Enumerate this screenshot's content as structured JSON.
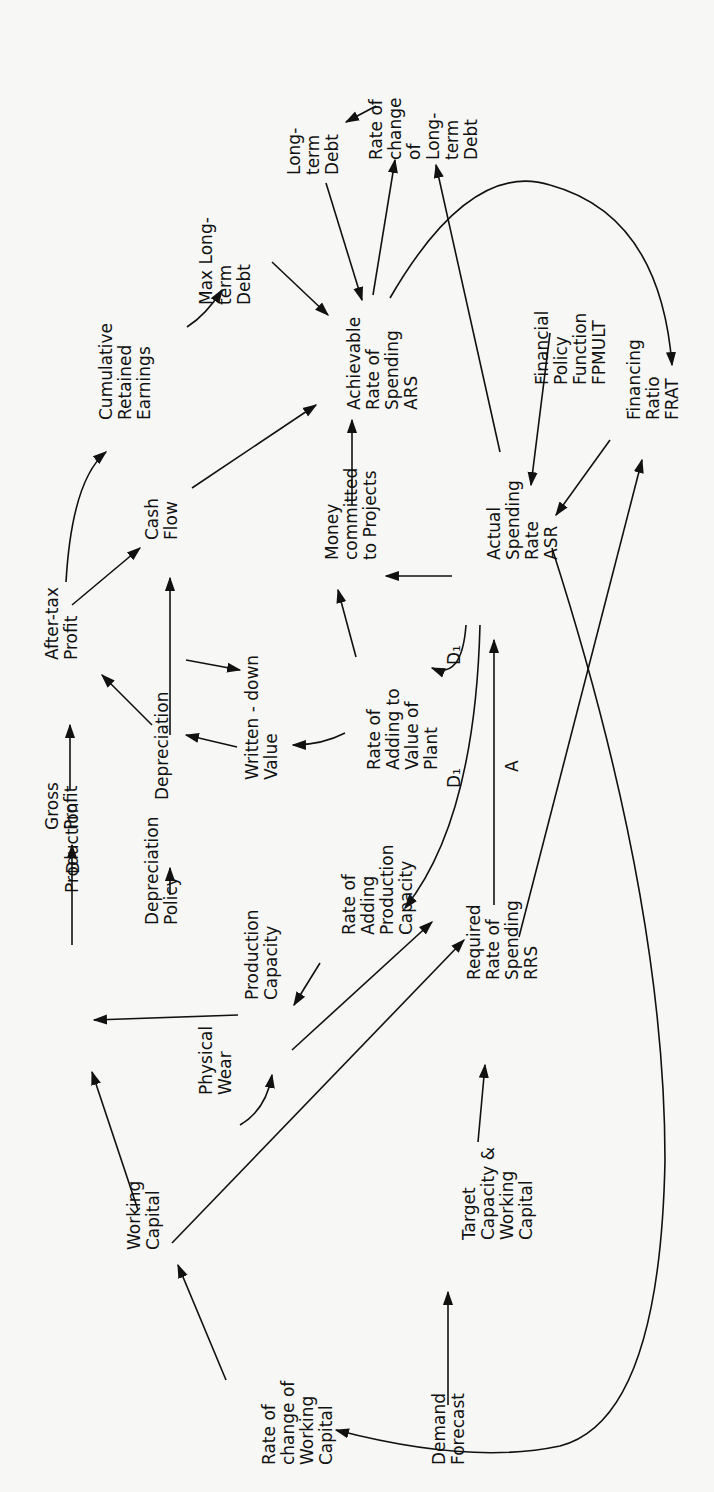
{
  "diagram": {
    "title": "",
    "orientation": "rotated-90-ccw",
    "colors": {
      "background": "#f7f7f5",
      "ink": "#111111"
    },
    "nodes": [
      {
        "id": "production",
        "lines": [
          "Production"
        ],
        "x": 78,
        "y": 893
      },
      {
        "id": "gross_profit",
        "lines": [
          "Gross",
          "Profit"
        ],
        "x": 58,
        "y": 830
      },
      {
        "id": "after_tax_profit",
        "lines": [
          "After-tax",
          "Profit"
        ],
        "x": 58,
        "y": 660
      },
      {
        "id": "cumulative_retained_earnings",
        "lines": [
          "Cumulative",
          "Retained",
          "Earnings"
        ],
        "x": 112,
        "y": 420
      },
      {
        "id": "max_long_term_debt",
        "lines": [
          "Max Long-",
          "term",
          "Debt"
        ],
        "x": 212,
        "y": 305
      },
      {
        "id": "long_term_debt",
        "lines": [
          "Long-",
          "term",
          "Debt"
        ],
        "x": 300,
        "y": 175
      },
      {
        "id": "rate_change_long_term_debt",
        "lines": [
          "Rate of",
          "change",
          "of",
          "Long-",
          "term",
          "Debt"
        ],
        "x": 382,
        "y": 160
      },
      {
        "id": "cash_flow",
        "lines": [
          "Cash",
          "Flow"
        ],
        "x": 158,
        "y": 540
      },
      {
        "id": "depreciation",
        "lines": [
          "Depreciation"
        ],
        "x": 168,
        "y": 800
      },
      {
        "id": "depreciation_policy",
        "lines": [
          "Depreciation",
          "Policy"
        ],
        "x": 158,
        "y": 925
      },
      {
        "id": "written_down_value",
        "lines": [
          "Written - down",
          "Value"
        ],
        "x": 258,
        "y": 780
      },
      {
        "id": "money_committed",
        "lines": [
          "Money",
          "committed",
          "to Projects"
        ],
        "x": 338,
        "y": 560
      },
      {
        "id": "achievable_rate_spending",
        "lines": [
          "Achievable",
          "Rate of",
          "Spending",
          "ARS"
        ],
        "x": 360,
        "y": 410
      },
      {
        "id": "rate_adding_value_plant",
        "lines": [
          "Rate of",
          "Adding to",
          "Value of",
          "Plant"
        ],
        "x": 380,
        "y": 770
      },
      {
        "id": "actual_spending_rate",
        "lines": [
          "Actual",
          "Spending",
          "Rate",
          "ASR"
        ],
        "x": 500,
        "y": 560
      },
      {
        "id": "financial_policy_function",
        "lines": [
          "Financial",
          "Policy",
          "Function",
          "FPMULT"
        ],
        "x": 548,
        "y": 385
      },
      {
        "id": "financing_ratio",
        "lines": [
          "Financing",
          "Ratio",
          "FRAT"
        ],
        "x": 640,
        "y": 420
      },
      {
        "id": "production_capacity",
        "lines": [
          "Production",
          "Capacity"
        ],
        "x": 258,
        "y": 1000
      },
      {
        "id": "physical_wear",
        "lines": [
          "Physical",
          "Wear"
        ],
        "x": 212,
        "y": 1095
      },
      {
        "id": "rate_adding_production_capacity",
        "lines": [
          "Rate of",
          "Adding",
          "Production",
          "Capacity"
        ],
        "x": 355,
        "y": 935
      },
      {
        "id": "required_rate_spending",
        "lines": [
          "Required",
          "Rate of",
          "Spending",
          "RRS"
        ],
        "x": 480,
        "y": 980
      },
      {
        "id": "working_capital",
        "lines": [
          "Working",
          "Capital"
        ],
        "x": 140,
        "y": 1250
      },
      {
        "id": "target_capacity_working_capital",
        "lines": [
          "Target",
          "Capacity &",
          "Working",
          "Capital"
        ],
        "x": 475,
        "y": 1240
      },
      {
        "id": "demand_forecast",
        "lines": [
          "Demand",
          "Forecast"
        ],
        "x": 445,
        "y": 1465
      },
      {
        "id": "rate_change_working_capital",
        "lines": [
          "Rate of",
          "change of",
          "Working",
          "Capital"
        ],
        "x": 275,
        "y": 1465
      }
    ],
    "edges": [
      {
        "from": "production",
        "to": "gross_profit",
        "delay": "D"
      },
      {
        "from": "gross_profit",
        "to": "after_tax_profit"
      },
      {
        "from": "depreciation",
        "to": "after_tax_profit"
      },
      {
        "from": "after_tax_profit",
        "to": "cash_flow"
      },
      {
        "from": "after_tax_profit",
        "to": "cumulative_retained_earnings"
      },
      {
        "from": "cumulative_retained_earnings",
        "to": "max_long_term_debt"
      },
      {
        "from": "max_long_term_debt",
        "to": "achievable_rate_spending"
      },
      {
        "from": "long_term_debt",
        "to": "achievable_rate_spending"
      },
      {
        "from": "achievable_rate_spending",
        "to": "rate_change_long_term_debt"
      },
      {
        "from": "rate_change_long_term_debt",
        "to": "long_term_debt"
      },
      {
        "from": "actual_spending_rate",
        "to": "rate_change_long_term_debt"
      },
      {
        "from": "achievable_rate_spending",
        "to": "financing_ratio"
      },
      {
        "from": "cash_flow",
        "to": "achievable_rate_spending"
      },
      {
        "from": "depreciation_policy",
        "to": "depreciation"
      },
      {
        "from": "depreciation",
        "to": "cash_flow"
      },
      {
        "from": "depreciation",
        "to": "written_down_value"
      },
      {
        "from": "written_down_value",
        "to": "depreciation"
      },
      {
        "from": "rate_adding_value_plant",
        "to": "written_down_value"
      },
      {
        "from": "rate_adding_value_plant",
        "to": "money_committed"
      },
      {
        "from": "money_committed",
        "to": "achievable_rate_spending"
      },
      {
        "from": "actual_spending_rate",
        "to": "money_committed"
      },
      {
        "from": "actual_spending_rate",
        "to": "rate_adding_value_plant",
        "delay": "D1"
      },
      {
        "from": "actual_spending_rate",
        "to": "rate_adding_production_capacity",
        "delay": "D1"
      },
      {
        "from": "required_rate_spending",
        "to": "actual_spending_rate",
        "label": "A"
      },
      {
        "from": "financial_policy_function",
        "to": "actual_spending_rate"
      },
      {
        "from": "financing_ratio",
        "to": "actual_spending_rate"
      },
      {
        "from": "required_rate_spending",
        "to": "financing_ratio"
      },
      {
        "from": "actual_spending_rate",
        "to": "rate_change_working_capital"
      },
      {
        "from": "rate_adding_production_capacity",
        "to": "production_capacity"
      },
      {
        "from": "physical_wear",
        "to": "production_capacity"
      },
      {
        "from": "production_capacity",
        "to": "production"
      },
      {
        "from": "production_capacity",
        "to": "required_rate_spending"
      },
      {
        "from": "working_capital",
        "to": "production"
      },
      {
        "from": "working_capital",
        "to": "required_rate_spending"
      },
      {
        "from": "target_capacity_working_capital",
        "to": "required_rate_spending"
      },
      {
        "from": "demand_forecast",
        "to": "target_capacity_working_capital"
      },
      {
        "from": "rate_change_working_capital",
        "to": "working_capital"
      }
    ],
    "edge_symbols": {
      "delay_D": "D",
      "delay_D1": "D₁",
      "label_A": "A"
    }
  }
}
